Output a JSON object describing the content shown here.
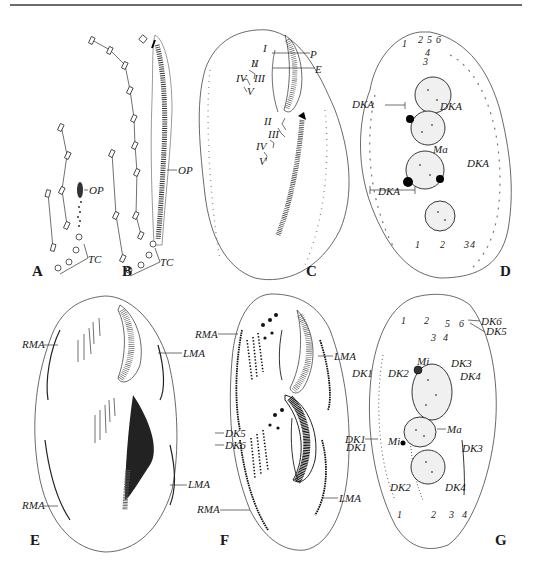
{
  "figure": {
    "panels": [
      {
        "id": "A",
        "letter": "A",
        "labels": [
          "OP",
          "TC"
        ]
      },
      {
        "id": "B",
        "letter": "B",
        "labels": [
          "OP",
          "TC"
        ]
      },
      {
        "id": "C",
        "letter": "C",
        "labels": [
          "P",
          "E",
          "I",
          "II",
          "III",
          "IV",
          "V",
          "II",
          "III",
          "IV",
          "V"
        ]
      },
      {
        "id": "D",
        "letter": "D",
        "labels": [
          "DKA",
          "DKA",
          "DKA",
          "DKA",
          "Ma"
        ],
        "kinety_numbers_top": [
          "1",
          "2",
          "3",
          "4",
          "5",
          "6"
        ],
        "kinety_numbers_bottom": [
          "1",
          "2",
          "3",
          "4"
        ]
      },
      {
        "id": "E",
        "letter": "E",
        "labels": [
          "RMA",
          "RMA",
          "LMA",
          "LMA"
        ]
      },
      {
        "id": "F",
        "letter": "F",
        "labels": [
          "RMA",
          "RMA",
          "LMA",
          "LMA",
          "DK5",
          "DK6",
          "DK1"
        ]
      },
      {
        "id": "G",
        "letter": "G",
        "labels": [
          "DK6",
          "DK5",
          "DK1",
          "DK2",
          "Mi",
          "DK3",
          "DK4",
          "DK1",
          "Mi",
          "Ma",
          "DK3",
          "DK2",
          "DK4"
        ],
        "kinety_numbers_top": [
          "1",
          "2",
          "3",
          "4",
          "5",
          "6"
        ],
        "kinety_numbers_bottom": [
          "1",
          "2",
          "3",
          "4"
        ]
      }
    ]
  },
  "labels": {
    "A": {
      "letter": "A",
      "op": "OP",
      "tc": "TC"
    },
    "B": {
      "letter": "B",
      "op": "OP",
      "tc": "TC"
    },
    "C": {
      "letter": "C",
      "p": "P",
      "e": "E",
      "r1": "I",
      "r2": "II",
      "r3": "III",
      "r4": "IV",
      "r5": "V",
      "o2": "II",
      "o3": "III",
      "o4": "IV",
      "o5": "V"
    },
    "D": {
      "letter": "D",
      "dka1": "DKA",
      "dka2": "DKA",
      "dka3": "DKA",
      "dka4": "DKA",
      "ma": "Ma",
      "t1": "1",
      "t2": "2",
      "t3": "3",
      "t4": "4",
      "t5": "5",
      "t6": "6",
      "b1": "1",
      "b2": "2",
      "b3": "3",
      "b4": "4"
    },
    "E": {
      "letter": "E",
      "rma1": "RMA",
      "rma2": "RMA",
      "lma1": "LMA",
      "lma2": "LMA"
    },
    "F": {
      "letter": "F",
      "rma1": "RMA",
      "rma2": "RMA",
      "lma1": "LMA",
      "lma2": "LMA",
      "dk5": "DK5",
      "dk6": "DK6",
      "dk1": "DK1"
    },
    "G": {
      "letter": "G",
      "dk6": "DK6",
      "dk5": "DK5",
      "dk1a": "DK1",
      "dk2a": "DK2",
      "mi1": "Mi",
      "dk3a": "DK3",
      "dk4a": "DK4",
      "dk1b": "DK1",
      "mi2": "Mi",
      "ma": "Ma",
      "dk3b": "DK3",
      "dk2b": "DK2",
      "dk4b": "DK4",
      "t1": "1",
      "t2": "2",
      "t3": "3",
      "t4": "4",
      "t5": "5",
      "t6": "6",
      "b1": "1",
      "b2": "2",
      "b3": "3",
      "b4": "4"
    }
  }
}
